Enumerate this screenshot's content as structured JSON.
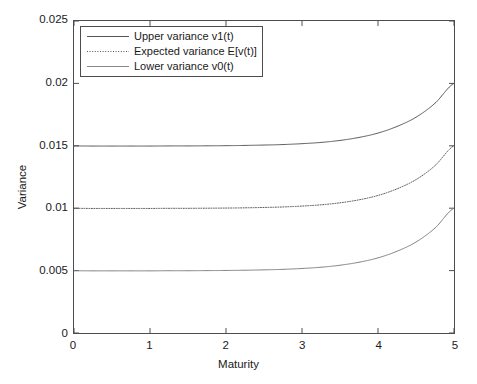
{
  "chart_data": {
    "type": "line",
    "title": "",
    "xlabel": "Maturity",
    "ylabel": "Variance",
    "xlim": [
      0,
      5
    ],
    "ylim": [
      0,
      0.025
    ],
    "xticks": [
      "0",
      "1",
      "2",
      "3",
      "4",
      "5"
    ],
    "yticks": [
      "0",
      "0.005",
      "0.01",
      "0.015",
      "0.02",
      "0.025"
    ],
    "grid": false,
    "legend_position": "upper left",
    "x": [
      0,
      0.25,
      0.5,
      0.75,
      1,
      1.25,
      1.5,
      1.75,
      2,
      2.25,
      2.5,
      2.75,
      3,
      3.25,
      3.5,
      3.75,
      4,
      4.25,
      4.5,
      4.75,
      5
    ],
    "series": [
      {
        "name": "Upper variance v1(t)",
        "style": "solid",
        "color": "#555555",
        "values": [
          0.01499,
          0.01498,
          0.01498,
          0.01498,
          0.01498,
          0.01499,
          0.01499,
          0.015,
          0.01501,
          0.01503,
          0.01506,
          0.0151,
          0.01517,
          0.01527,
          0.01543,
          0.01567,
          0.01602,
          0.01655,
          0.01729,
          0.01841,
          0.02
        ]
      },
      {
        "name": "Expected variance E[v(t)]",
        "style": "dotted",
        "color": "#555555",
        "values": [
          0.00999,
          0.00998,
          0.00998,
          0.00998,
          0.00998,
          0.00999,
          0.00999,
          0.01,
          0.01001,
          0.01003,
          0.01006,
          0.0101,
          0.01017,
          0.01027,
          0.01043,
          0.01067,
          0.01102,
          0.01155,
          0.01229,
          0.01341,
          0.015
        ]
      },
      {
        "name": "Lower variance v0(t)",
        "style": "solid",
        "color": "#555555",
        "values": [
          0.00499,
          0.00498,
          0.00498,
          0.00498,
          0.00498,
          0.00499,
          0.00499,
          0.005,
          0.00501,
          0.00503,
          0.00506,
          0.0051,
          0.00517,
          0.00527,
          0.00543,
          0.00567,
          0.00602,
          0.00655,
          0.00729,
          0.00841,
          0.01
        ]
      }
    ]
  },
  "axes": {
    "y_tick_labels": [
      "0.025",
      "0.02",
      "0.015",
      "0.01",
      "0.005",
      "0"
    ],
    "x_tick_labels": [
      "0",
      "1",
      "2",
      "3",
      "4",
      "5"
    ],
    "x_title": "Maturity",
    "y_title": "Variance"
  },
  "legend": {
    "entries": [
      {
        "label": "Upper variance v1(t)",
        "style": "solid"
      },
      {
        "label": "Expected variance E[v(t)]",
        "style": "dotted"
      },
      {
        "label": "Lower variance v0(t)",
        "style": "solid"
      }
    ]
  },
  "colors": {
    "line": "#555555",
    "axis": "#4d4d4d",
    "text": "#1a1a1a",
    "background": "#ffffff"
  }
}
